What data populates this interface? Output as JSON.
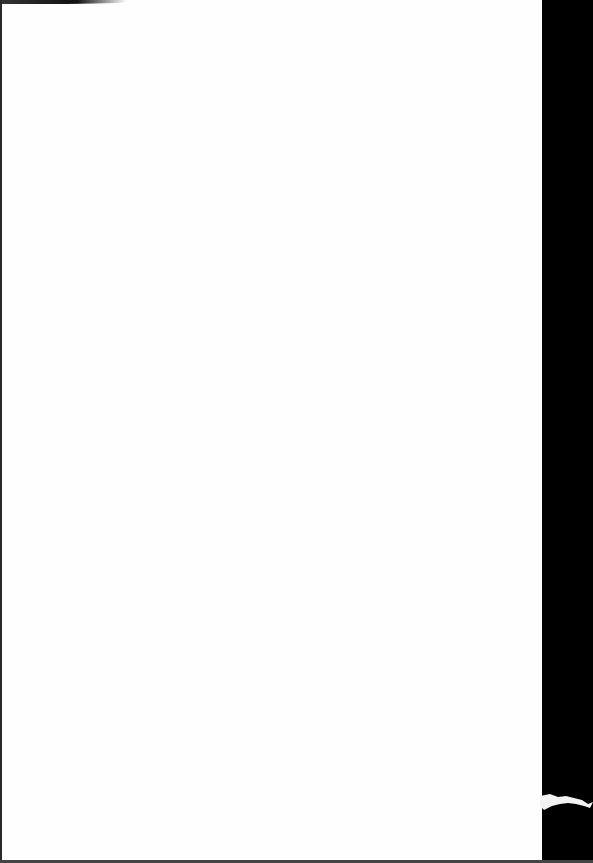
{
  "document": {
    "type": "scanned-page",
    "content": "",
    "colors": {
      "page": "#fefefe",
      "background": "#000000"
    }
  }
}
